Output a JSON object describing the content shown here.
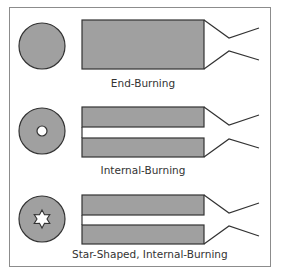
{
  "diagram": {
    "colors": {
      "propellant": "#a0a0a0",
      "outline": "#333333",
      "frame": "#8c8c8c",
      "text": "#333333"
    },
    "configurations": [
      {
        "id": "end-burning",
        "label": "End-Burning",
        "cross_section": "solid-circle",
        "bore": "none"
      },
      {
        "id": "internal-burning",
        "label": "Internal-Burning",
        "cross_section": "circle-with-round-hole",
        "bore": "cylindrical"
      },
      {
        "id": "star-internal-burning",
        "label": "Star-Shaped, Internal-Burning",
        "cross_section": "circle-with-star-hole",
        "bore": "star"
      }
    ]
  }
}
